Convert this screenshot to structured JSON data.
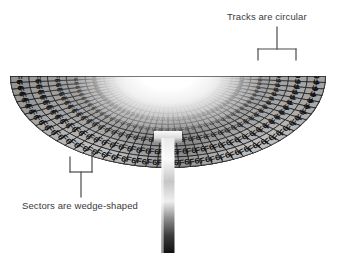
{
  "figure": {
    "kind": "disk-platter-diagram",
    "background_color": "#ffffff"
  },
  "callouts": [
    {
      "id": "tracks",
      "label": "Tracks are circular",
      "bracket": "down-two-legs",
      "points_at": "two outermost concentric track rows on the right side"
    },
    {
      "id": "sectors",
      "label": "Sectors are wedge-shaped",
      "bracket": "up-two-legs",
      "points_at": "two adjacent radial sector wedges on the lower left"
    }
  ],
  "platter": {
    "shape": "semicircle",
    "center_x": 168,
    "center_y": 76,
    "radius_x": 158,
    "radius_y": 92,
    "track_count": 7,
    "sector_count": 44,
    "hub_color": "#ffffff",
    "surface_dark": "#2a2a2a",
    "surface_light": "#d8d8d8",
    "cell_text_color": "#111111",
    "cell_values": {
      "outer_ring_1": "F6",
      "outer_ring_2": "F6",
      "big_ring_left": "03",
      "big_ring_right": "02",
      "inner_rings": "F6"
    },
    "ring_labels": [
      "F6",
      "F6",
      "03",
      "F6",
      "F6",
      "F6",
      "F6"
    ],
    "left_big_value": "03",
    "right_big_value": "02",
    "repeat_value": "F6"
  },
  "head": {
    "name": "read-write-head",
    "arm_color_light": "#f2f2f2",
    "arm_color_dark": "#1a1a1a",
    "arm_x": 168,
    "arm_top": 131,
    "arm_bottom": 253,
    "arm_width": 13,
    "head_width": 28,
    "head_height": 12
  },
  "colors": {
    "annotation_line": "#4a4a4a",
    "text": "#3a3a3a"
  }
}
